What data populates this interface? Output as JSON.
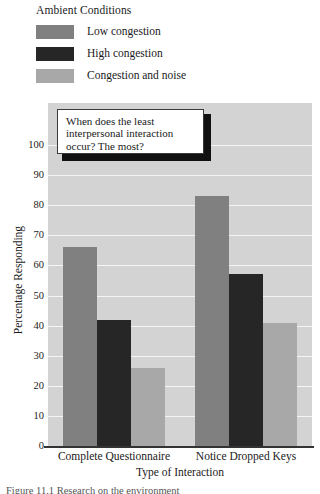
{
  "legend": {
    "title": "Ambient Conditions",
    "entries": [
      {
        "label": "Low congestion",
        "color": "#808080"
      },
      {
        "label": "High congestion",
        "color": "#262626"
      },
      {
        "label": "Congestion and noise",
        "color": "#a8a8a8"
      }
    ]
  },
  "callout": {
    "text": "When does the least interpersonal interaction occur? The most?"
  },
  "caption": {
    "text": "Figure 11.1   Research on the environment"
  },
  "chart_data": {
    "type": "bar",
    "title": "",
    "xlabel": "Type of Interaction",
    "ylabel": "Percentage Responding",
    "categories": [
      "Complete Questionnaire",
      "Notice Dropped Keys"
    ],
    "series": [
      {
        "name": "Low congestion",
        "color": "#808080",
        "values": [
          66,
          83
        ]
      },
      {
        "name": "High congestion",
        "color": "#262626",
        "values": [
          42,
          57
        ]
      },
      {
        "name": "Congestion and noise",
        "color": "#a8a8a8",
        "values": [
          26,
          41
        ]
      }
    ],
    "ylim": [
      0,
      100
    ],
    "yticks": [
      0,
      10,
      20,
      30,
      40,
      50,
      60,
      70,
      80,
      90,
      100
    ],
    "ytick_labels": [
      "0",
      "10",
      "20",
      "30",
      "40",
      "50",
      "60",
      "70",
      "80",
      "90",
      "100"
    ],
    "grid": true,
    "grid_color": "#f4f4f4",
    "plot_background": "#d3d3d3",
    "legend_position": "above-plot"
  }
}
